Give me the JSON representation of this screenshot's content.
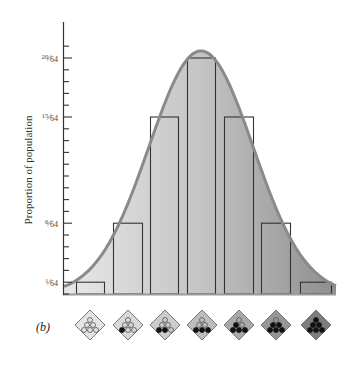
{
  "panel_label": "(b)",
  "chart_data": {
    "type": "bar",
    "title": "",
    "xlabel": "",
    "ylabel": "Proportion of population",
    "categories": [
      "0 dark alleles",
      "1 dark allele",
      "2 dark alleles",
      "3 dark alleles",
      "4 dark alleles",
      "5 dark alleles",
      "6 dark alleles"
    ],
    "values": [
      1,
      6,
      15,
      20,
      15,
      6,
      1
    ],
    "value_denominator": 64,
    "value_labels": [
      "1/64",
      "6/64",
      "15/64",
      "20/64",
      "15/64",
      "6/64",
      "1/64"
    ],
    "ytick_labels": [
      "1/64",
      "6/64",
      "15/64",
      "20/64"
    ],
    "ytick_values": [
      1,
      6,
      15,
      20
    ],
    "ylim": [
      0,
      22
    ],
    "grid": false,
    "overlay": "normal distribution curve",
    "legend": "none"
  },
  "y_axis": {
    "label": "Proportion of population",
    "ticks": [
      {
        "num": "1",
        "den": "64",
        "value": 1
      },
      {
        "num": "6",
        "den": "64",
        "value": 6
      },
      {
        "num": "15",
        "den": "64",
        "value": 15
      },
      {
        "num": "20",
        "den": "64",
        "value": 20
      }
    ]
  },
  "genotypes": [
    {
      "dark": 0,
      "total": 6,
      "fill": "#e4e4e4"
    },
    {
      "dark": 1,
      "total": 6,
      "fill": "#d8d8d8"
    },
    {
      "dark": 2,
      "total": 6,
      "fill": "#cccccc"
    },
    {
      "dark": 3,
      "total": 6,
      "fill": "#bdbdbd"
    },
    {
      "dark": 4,
      "total": 6,
      "fill": "#a9a9a9"
    },
    {
      "dark": 5,
      "total": 6,
      "fill": "#969696"
    },
    {
      "dark": 6,
      "total": 6,
      "fill": "#7d7d7d"
    }
  ],
  "colors": {
    "curve": "#8a8a8a",
    "bar_outline": "#333333",
    "axis": "#333333",
    "fill_light": "#e6e6e6",
    "fill_dark": "#8c8c8c"
  }
}
